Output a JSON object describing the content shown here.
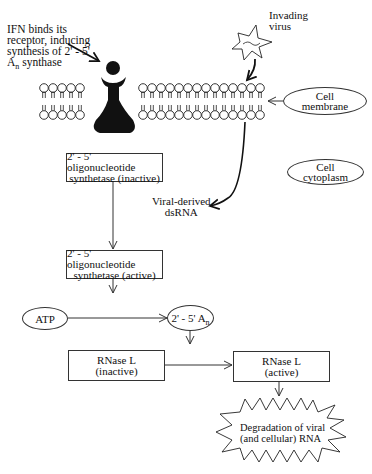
{
  "ifn_label": {
    "line1": "IFN binds its",
    "line2": "receptor, inducing",
    "line3": "synthesis of 2' - 5'",
    "line4_main": "A",
    "line4_sub": "n",
    "line4_rest": " synthase"
  },
  "virus_label": {
    "line1": "Invading",
    "line2": "virus"
  },
  "cell_membrane": {
    "line1": "Cell",
    "line2": "membrane"
  },
  "cell_cytoplasm": {
    "line1": "Cell",
    "line2": "cytoplasm"
  },
  "dsrna_label": {
    "line1": "Viral-derived",
    "line2": "dsRNA"
  },
  "oas_inactive": {
    "line1": "2' - 5' oligonucleotide",
    "line2": "synthetase (inactive)"
  },
  "oas_active": {
    "line1": "2' - 5' oligonucleotide",
    "line2": "synthetase (active)"
  },
  "atp": {
    "label": "ATP"
  },
  "two_five_an": {
    "main": "2' - 5' A",
    "sub": "n"
  },
  "rnase_inactive": {
    "line1": "RNase L",
    "line2": "(inactive)"
  },
  "rnase_active": {
    "line1": "RNase L",
    "line2": "(active)"
  },
  "degradation": {
    "line1": "Degradation of viral",
    "line2": "(and cellular) RNA"
  }
}
